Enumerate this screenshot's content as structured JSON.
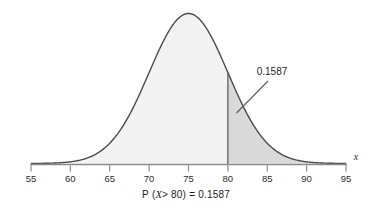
{
  "figure": {
    "caption_prefix": "P",
    "caption_var": "X",
    "caption_rest": "> 80) = 0.1587",
    "caption_full": "P (X > 80) = 0.1587",
    "annotation_label": "0.1587",
    "axis_name": "x",
    "curve_color": "#4a4a4a",
    "axis_color": "#8a8a8a",
    "body_fill": "#f2f2f2",
    "tail_fill": "#d9d9d9",
    "text_color": "#1e1e1e"
  },
  "chart_data": {
    "type": "area",
    "title": "",
    "subtitle": "",
    "xlabel": "x",
    "ylabel": "",
    "distribution": "normal",
    "mean": 75,
    "std": 5,
    "cut_value": 80,
    "tail_side": "right",
    "tail_probability": 0.1587,
    "body_probability": 0.8413,
    "xlim": [
      55,
      95
    ],
    "ylim": [
      0,
      0.0885
    ],
    "grid": false,
    "legend": null,
    "xticks": [
      55,
      60,
      65,
      70,
      75,
      80,
      85,
      90,
      95
    ],
    "xticklabels": [
      "55",
      "60",
      "65",
      "70",
      "75",
      "80",
      "85",
      "90",
      "95"
    ],
    "annotations": [
      {
        "text": "0.1587",
        "points_to_x": 81.5,
        "points_to_y": 0.035
      },
      {
        "text": "P (X > 80) = 0.1587",
        "position": "below-axis"
      }
    ],
    "x": [
      55,
      56,
      57,
      58,
      59,
      60,
      61,
      62,
      63,
      64,
      65,
      66,
      67,
      68,
      69,
      70,
      71,
      72,
      73,
      74,
      75,
      76,
      77,
      78,
      79,
      80,
      81,
      82,
      83,
      84,
      85,
      86,
      87,
      88,
      89,
      90,
      91,
      92,
      93,
      94,
      95
    ],
    "y": [
      0.0001,
      0.0002,
      0.0004,
      0.0009,
      0.0018,
      0.0033,
      0.0058,
      0.0094,
      0.0144,
      0.0208,
      0.0284,
      0.0368,
      0.045,
      0.0525,
      0.0579,
      0.0605,
      0.0598,
      0.0558,
      0.0489,
      0.0403,
      0.0315,
      0.0231,
      0.016,
      0.0104,
      0.0064,
      0.0037,
      0.002,
      0.001,
      0.0005,
      0.0002,
      0.0001,
      0.0,
      0.0,
      0.0,
      0.0,
      0.0,
      0.0,
      0.0,
      0.0,
      0.0,
      0.0
    ]
  }
}
